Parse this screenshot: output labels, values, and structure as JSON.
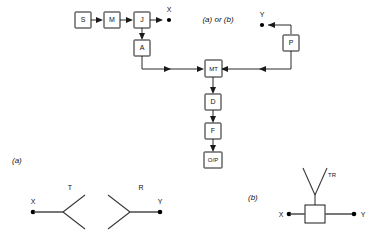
{
  "diagram": {
    "center_note": "(a) or (b)",
    "panel_a_label": "(a)",
    "panel_b_label": "(b)",
    "blocks": [
      {
        "id": "S",
        "label": "S",
        "x": 75,
        "y": 12
      },
      {
        "id": "M",
        "label": "M",
        "x": 104,
        "y": 12
      },
      {
        "id": "J",
        "label": "J",
        "x": 134,
        "y": 12
      },
      {
        "id": "A",
        "label": "A",
        "x": 134,
        "y": 40
      },
      {
        "id": "MT",
        "label": "MT",
        "x": 205,
        "y": 60
      },
      {
        "id": "D",
        "label": "D",
        "x": 205,
        "y": 94
      },
      {
        "id": "F",
        "label": "F",
        "x": 205,
        "y": 123
      },
      {
        "id": "OP",
        "label": "O/P",
        "x": 205,
        "y": 152
      },
      {
        "id": "P",
        "label": "P",
        "x": 283,
        "y": 35
      }
    ],
    "terminals": [
      {
        "id": "X-top",
        "label": "X",
        "x": 172,
        "y": 20
      },
      {
        "id": "Y-top",
        "label": "Y",
        "x": 263,
        "y": 20
      },
      {
        "id": "X-panel-a",
        "label": "X",
        "x": 33,
        "y": 212
      },
      {
        "id": "Y-panel-a",
        "label": "Y",
        "x": 160,
        "y": 212
      },
      {
        "id": "X-panel-b",
        "label": "X",
        "x": 281,
        "y": 212
      },
      {
        "id": "Y-panel-b",
        "label": "Y",
        "x": 355,
        "y": 212
      }
    ],
    "antenna_labels": [
      {
        "id": "T",
        "label": "T",
        "x": 70,
        "y": 190
      },
      {
        "id": "R",
        "label": "R",
        "x": 141,
        "y": 190
      },
      {
        "id": "TR",
        "label": "TR",
        "x": 316,
        "y": 177
      }
    ],
    "colors": {
      "line": "#2b2b2b",
      "box_stroke": "#1a1a1a",
      "text": "#111111",
      "background": "#ffffff"
    }
  }
}
